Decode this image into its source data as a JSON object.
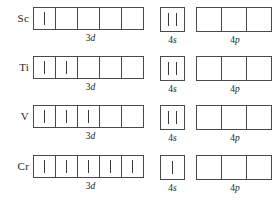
{
  "diagram": {
    "subshell_labels": {
      "d": {
        "n": "3",
        "letter": "d"
      },
      "s": {
        "n": "4",
        "letter": "s"
      },
      "p": {
        "n": "4",
        "letter": "p"
      }
    },
    "box_counts": {
      "d": 5,
      "s": 1,
      "p": 3
    },
    "rows": [
      {
        "element": "Sc",
        "d_occupancy": [
          1,
          0,
          0,
          0,
          0
        ],
        "s_occupancy": [
          2
        ],
        "p_occupancy": [
          0,
          0,
          0
        ]
      },
      {
        "element": "Ti",
        "d_occupancy": [
          1,
          1,
          0,
          0,
          0
        ],
        "s_occupancy": [
          2
        ],
        "p_occupancy": [
          0,
          0,
          0
        ]
      },
      {
        "element": "V",
        "d_occupancy": [
          1,
          1,
          1,
          0,
          0
        ],
        "s_occupancy": [
          2
        ],
        "p_occupancy": [
          0,
          0,
          0
        ]
      },
      {
        "element": "Cr",
        "d_occupancy": [
          1,
          1,
          1,
          1,
          1
        ],
        "s_occupancy": [
          1
        ],
        "p_occupancy": [
          0,
          0,
          0
        ]
      }
    ]
  }
}
